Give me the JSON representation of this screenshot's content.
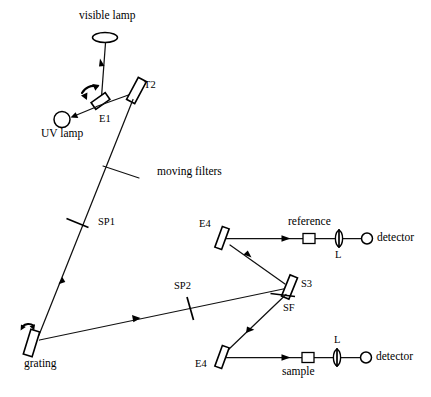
{
  "diagram": {
    "type": "optical-ray-diagram",
    "canvas": {
      "width": 431,
      "height": 397
    },
    "colors": {
      "ink": "#000000",
      "background": "#ffffff"
    },
    "labels": {
      "visible_lamp": "visible lamp",
      "uv_lamp": "UV lamp",
      "e1": "E1",
      "t2": "T2",
      "moving_filters": "moving filters",
      "sp1": "SP1",
      "sp2": "SP2",
      "grating": "grating",
      "e4_upper": "E4",
      "e4_lower": "E4",
      "s3": "S3",
      "sf": "SF",
      "reference": "reference",
      "sample": "sample",
      "lens_upper": "L",
      "lens_lower": "L",
      "detector_upper": "detector",
      "detector_lower": "detector"
    },
    "components": [
      {
        "id": "visible-lamp",
        "kind": "lamp-ellipse",
        "label": "visible lamp"
      },
      {
        "id": "uv-lamp",
        "kind": "lamp-circle",
        "label": "UV lamp"
      },
      {
        "id": "e1-mirror",
        "kind": "mirror",
        "label": "E1",
        "rotating": true
      },
      {
        "id": "t2-mirror",
        "kind": "mirror",
        "label": "T2",
        "rotating": false
      },
      {
        "id": "moving-filters",
        "kind": "filter-wheel",
        "label": "moving filters"
      },
      {
        "id": "sp1-slit",
        "kind": "slit",
        "label": "SP1"
      },
      {
        "id": "grating",
        "kind": "grating",
        "label": "grating",
        "rotating": true
      },
      {
        "id": "sp2-slit",
        "kind": "slit",
        "label": "SP2"
      },
      {
        "id": "s3-splitter",
        "kind": "beam-splitter",
        "label": "S3"
      },
      {
        "id": "sf-element",
        "kind": "flat-element",
        "label": "SF"
      },
      {
        "id": "e4-upper-mirror",
        "kind": "mirror",
        "label": "E4"
      },
      {
        "id": "e4-lower-mirror",
        "kind": "mirror",
        "label": "E4"
      },
      {
        "id": "reference-cell",
        "kind": "cuvette",
        "label": "reference"
      },
      {
        "id": "sample-cell",
        "kind": "cuvette",
        "label": "sample"
      },
      {
        "id": "lens-upper",
        "kind": "lens",
        "label": "L"
      },
      {
        "id": "lens-lower",
        "kind": "lens",
        "label": "L"
      },
      {
        "id": "detector-upper",
        "kind": "detector",
        "label": "detector"
      },
      {
        "id": "detector-lower",
        "kind": "detector",
        "label": "detector"
      }
    ],
    "beam_paths": [
      {
        "id": "visible-to-e1",
        "from": "visible-lamp",
        "to": "e1-mirror",
        "arrow": true
      },
      {
        "id": "e1-to-uv",
        "from": "e1-mirror",
        "to": "uv-lamp",
        "arrow": true
      },
      {
        "id": "e1-to-t2",
        "from": "e1-mirror",
        "to": "t2-mirror",
        "arrow": false
      },
      {
        "id": "t2-to-grating",
        "from": "t2-mirror",
        "to": "grating",
        "arrow": true
      },
      {
        "id": "grating-to-s3",
        "from": "grating",
        "to": "s3-splitter",
        "arrow": true
      },
      {
        "id": "s3-to-e4-upper",
        "from": "s3-splitter",
        "to": "e4-upper-mirror",
        "arrow": true
      },
      {
        "id": "s3-to-e4-lower",
        "from": "s3-splitter",
        "to": "e4-lower-mirror",
        "arrow": true
      },
      {
        "id": "e4-upper-to-detect",
        "from": "e4-upper-mirror",
        "to": "detector-upper",
        "arrow": true
      },
      {
        "id": "e4-lower-to-detect",
        "from": "e4-lower-mirror",
        "to": "detector-lower",
        "arrow": true
      }
    ]
  }
}
